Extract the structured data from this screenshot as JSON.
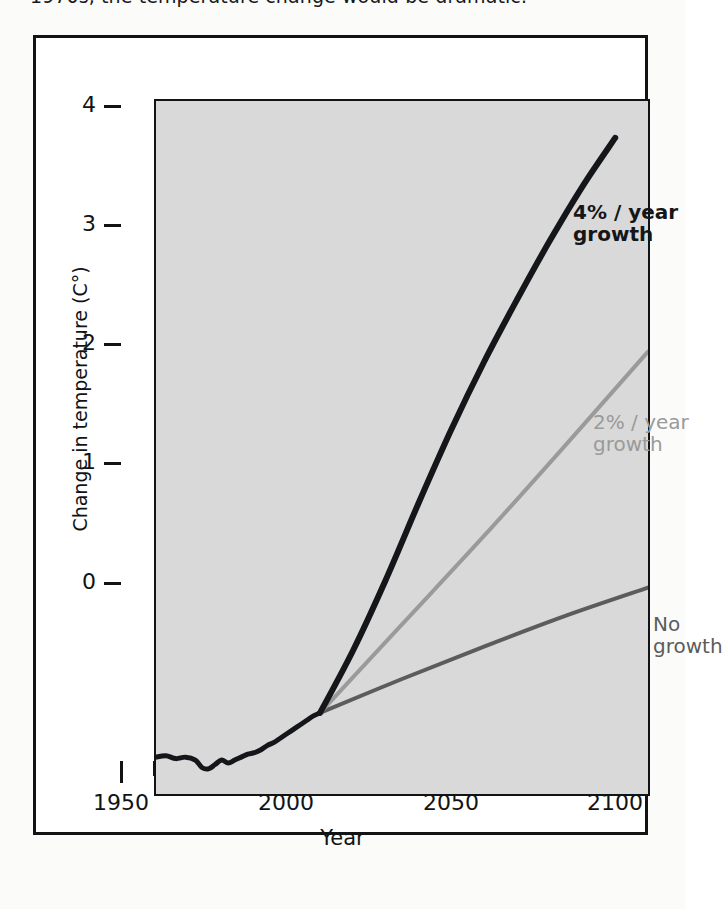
{
  "caption": {
    "text": "1970s, the temperature change would be dramatic."
  },
  "figure": {
    "y_axis_title": "Change in temperature (C°)",
    "x_axis_title": "Year"
  },
  "annotations": {
    "high": "4% / year\ngrowth",
    "mid": "2% / year\ngrowth",
    "none": "No\ngrowth"
  },
  "axis": {
    "y_ticks": [
      "0",
      "1",
      "2",
      "3",
      "4"
    ],
    "x_ticks": [
      "1950",
      "2000",
      "2050",
      "2100"
    ]
  },
  "colors": {
    "panel_background": "#d9d9d9",
    "frame": "#111315",
    "series_high": "#141619",
    "series_mid": "#9a9a9a",
    "series_none": "#5c5c5c",
    "page_background": "#fbfbfa"
  },
  "chart_data": {
    "type": "line",
    "title": "",
    "xlabel": "Year",
    "ylabel": "Change in temperature (C°)",
    "xlim": [
      1950,
      2100
    ],
    "ylim": [
      -0.25,
      4.45
    ],
    "grid": false,
    "legend": "inline-annotations",
    "x_tick_values": [
      1950,
      2000,
      2050,
      2100
    ],
    "x_minor_tick_values": [
      1960,
      1970,
      1980,
      1990
    ],
    "y_tick_values": [
      0,
      1,
      2,
      3,
      4
    ],
    "branch_point": {
      "x": 2000,
      "y": 0.3
    },
    "series": [
      {
        "name": "Historical record",
        "color": "#141619",
        "width": 5,
        "x": [
          1950,
          1953,
          1956,
          1959,
          1962,
          1964,
          1966,
          1968,
          1970,
          1972,
          1974,
          1976,
          1978,
          1980,
          1982,
          1984,
          1986,
          1988,
          1990,
          1992,
          1994,
          1996,
          1998,
          2000
        ],
        "y": [
          0.0,
          0.01,
          -0.01,
          0.0,
          -0.02,
          -0.07,
          -0.08,
          -0.05,
          -0.02,
          -0.04,
          -0.02,
          0.0,
          0.02,
          0.03,
          0.05,
          0.08,
          0.1,
          0.13,
          0.16,
          0.19,
          0.22,
          0.25,
          0.28,
          0.3
        ]
      },
      {
        "name": "4% / year growth",
        "color": "#141619",
        "width": 6,
        "x": [
          2000,
          2010,
          2020,
          2030,
          2040,
          2050,
          2060,
          2070,
          2080,
          2090
        ],
        "y": [
          0.3,
          0.72,
          1.2,
          1.72,
          2.22,
          2.68,
          3.1,
          3.5,
          3.87,
          4.2
        ]
      },
      {
        "name": "2% / year growth",
        "color": "#9a9a9a",
        "width": 4,
        "x": [
          2000,
          2025,
          2050,
          2075,
          2100
        ],
        "y": [
          0.3,
          0.9,
          1.5,
          2.12,
          2.75
        ]
      },
      {
        "name": "No growth",
        "color": "#5c5c5c",
        "width": 4,
        "x": [
          2000,
          2025,
          2050,
          2075,
          2100
        ],
        "y": [
          0.3,
          0.53,
          0.75,
          0.96,
          1.15
        ]
      }
    ]
  }
}
